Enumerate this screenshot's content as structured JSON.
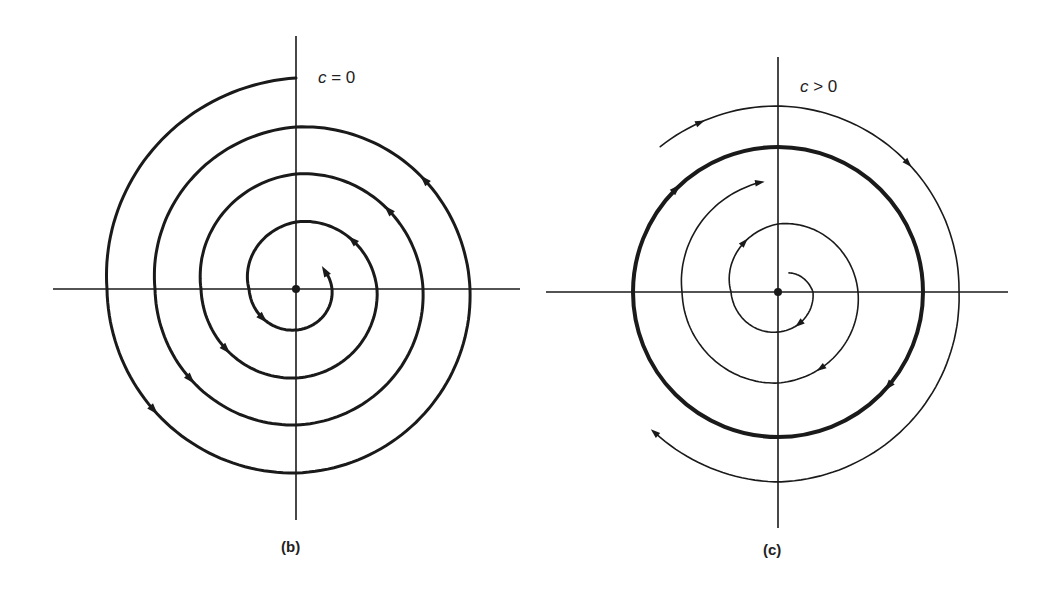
{
  "figure": {
    "ink_color": "#1a1a1a",
    "background": "#ffffff",
    "panels": [
      {
        "id": "b",
        "caption": "(b)",
        "condition_var": "c",
        "condition_rest": " = 0",
        "center": [
          296,
          289
        ],
        "axes": {
          "x": [
            53,
            520
          ],
          "y": [
            36,
            520
          ]
        },
        "caption_pos": [
          281,
          538
        ],
        "condition_pos": [
          318,
          68
        ],
        "description": "Stable spiral: trajectory winds counterclockwise inward toward the origin",
        "curves": [
          {
            "name": "inward-spiral",
            "direction": "counterclockwise",
            "stroke_width": 3,
            "start_angle_deg": -90,
            "end_angle_deg": 1290,
            "radii_samples_deg": [
              [
                -90,
                211
              ],
              [
                0,
                189
              ],
              [
                90,
                184
              ],
              [
                180,
                174
              ],
              [
                270,
                162
              ],
              [
                360,
                141
              ],
              [
                450,
                136
              ],
              [
                540,
                127
              ],
              [
                630,
                115
              ],
              [
                720,
                95
              ],
              [
                810,
                89
              ],
              [
                900,
                81
              ],
              [
                990,
                67
              ],
              [
                1080,
                47
              ],
              [
                1170,
                41
              ],
              [
                1260,
                36
              ],
              [
                1290,
                34
              ]
            ],
            "arrows_at_deg": [
              40,
              220,
              400,
              580,
              760,
              940,
              1120,
              1290
            ],
            "end_arrow": true
          }
        ]
      },
      {
        "id": "c",
        "caption": "(c)",
        "condition_var": "c",
        "condition_rest": " > 0",
        "center": [
          778,
          292
        ],
        "axes": {
          "x": [
            546,
            1008
          ],
          "y": [
            57,
            528
          ]
        },
        "caption_pos": [
          763,
          541
        ],
        "condition_pos": [
          800,
          77
        ],
        "description": "Stable limit cycle (thick) approached from inside and outside, trajectories move clockwise",
        "curves": [
          {
            "name": "limit-cycle",
            "direction": "clockwise",
            "stroke_width": 4,
            "full_circle": true,
            "radius": 145,
            "arrows_at_deg": [
              -135,
              40
            ]
          },
          {
            "name": "inner-spiral-outward",
            "direction": "clockwise",
            "stroke_width": 1.6,
            "radii_samples_deg": [
              [
                -60,
                22
              ],
              [
                0,
                35
              ],
              [
                90,
                40
              ],
              [
                180,
                47
              ],
              [
                270,
                68
              ],
              [
                360,
                80
              ],
              [
                450,
                91
              ],
              [
                540,
                96
              ],
              [
                620,
                111
              ]
            ],
            "arrows_at_deg": [
              55,
              235,
              420,
              620
            ],
            "end_arrow": true
          },
          {
            "name": "outer-spiral-inward",
            "direction": "clockwise",
            "stroke_width": 1.6,
            "radii_samples_deg": [
              [
                -129,
                187
              ],
              [
                -90,
                186
              ],
              [
                -45,
                183
              ],
              [
                0,
                181
              ],
              [
                90,
                190
              ],
              [
                131,
                187
              ]
            ],
            "arrows_at_deg": [
              -115,
              -45,
              131
            ],
            "end_arrow": true
          }
        ]
      }
    ]
  }
}
